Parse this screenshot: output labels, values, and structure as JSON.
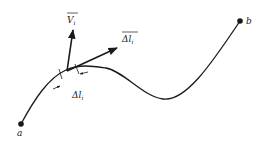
{
  "diagram": {
    "point_a_label": "a",
    "point_b_label": "b",
    "vector_v_label": "V",
    "vector_v_subscript": "i",
    "vector_dl_label": "Δl",
    "vector_dl_subscript": "i",
    "segment_label": "Δl",
    "segment_subscript": "i",
    "stroke_color": "#1a1a1a"
  }
}
